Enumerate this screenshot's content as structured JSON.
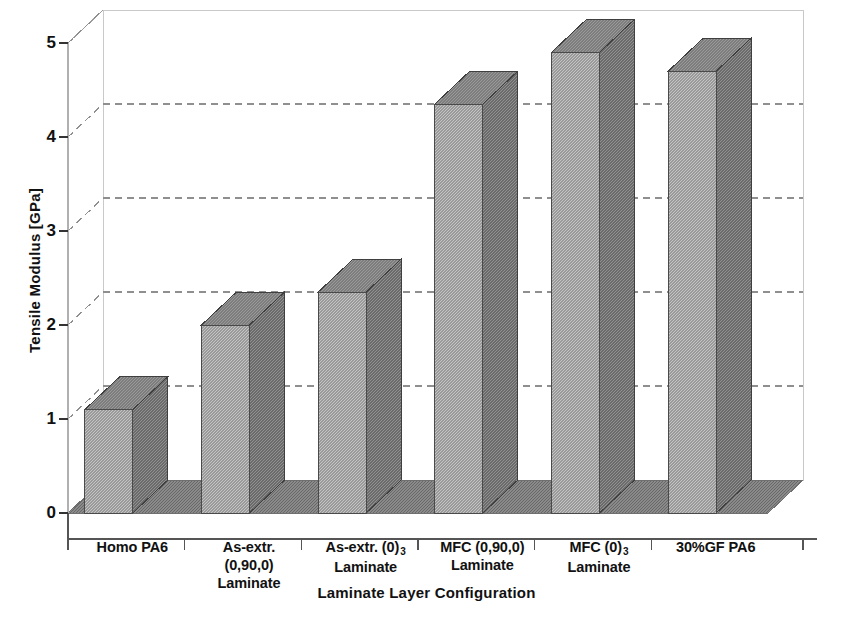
{
  "chart_data": {
    "type": "bar",
    "title": "",
    "xlabel": "Laminate Layer Configuration",
    "ylabel": "Tensile Modulus [GPa]",
    "categories": [
      "Homo PA6",
      "As-extr. (0,90,0) Laminate",
      "As-extr. (0)3 Laminate",
      "MFC (0,90,0) Laminate",
      "MFC (0)3 Laminate",
      "30%GF PA6"
    ],
    "category_lines": [
      [
        "Homo PA6"
      ],
      [
        "As-extr.",
        "(0,90,0)",
        "Laminate"
      ],
      [
        "As-extr. (0)",
        "Laminate"
      ],
      [
        "MFC (0,90,0)",
        "Laminate"
      ],
      [
        "MFC  (0)",
        "Laminate"
      ],
      [
        "30%GF PA6"
      ]
    ],
    "category_subscripts": [
      "",
      "",
      "3",
      "",
      "3",
      ""
    ],
    "values": [
      1.1,
      2.0,
      2.35,
      4.35,
      4.9,
      4.7
    ],
    "ylim": [
      0,
      5
    ],
    "yticks": [
      0,
      1,
      2,
      3,
      4,
      5
    ],
    "ytick_labels": [
      "0",
      "1",
      "2",
      "3",
      "4",
      "5"
    ],
    "grid": true,
    "grid_style": "dashed",
    "legend": "none",
    "style": "3d-column",
    "colors": {
      "bar_front": "#9a9a9a",
      "bar_side": "#6b6b6b",
      "bar_top": "#7d7d7d",
      "floor": "#8a8a8a",
      "grid": "#8f8f8f",
      "axis": "#b8b8b8",
      "text": "#111111"
    }
  }
}
